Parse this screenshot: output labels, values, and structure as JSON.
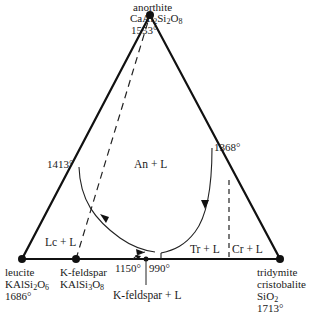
{
  "diagram": {
    "type": "ternary phase diagram",
    "vertices": {
      "top": {
        "mineral": "anorthite",
        "formula_parts": [
          "CaAl",
          "2",
          "Si",
          "2",
          "O",
          "8"
        ],
        "temp": "1553°"
      },
      "left": {
        "mineral": "leucite",
        "formula_parts": [
          "KAlSi",
          "2",
          "O",
          "6"
        ],
        "temp": "1686°"
      },
      "right": {
        "mineral1": "tridymite",
        "mineral2": "cristobalite",
        "formula_parts": [
          "SiO",
          "2"
        ],
        "temp": "1713°"
      }
    },
    "intermediate": {
      "mineral": "K-feldspar",
      "formula_parts": [
        "KAlSi",
        "3",
        "O",
        "8"
      ]
    },
    "points": {
      "left_edge": "1413°",
      "right_edge": "1368°",
      "peritectic": "1150°",
      "eutectic": "990°"
    },
    "fields": {
      "anorthite": "An + L",
      "leucite": "Lc + L",
      "tridymite": "Tr + L",
      "cristobalite": "Cr + L",
      "kfeldspar": "K-feldspar + L"
    }
  }
}
